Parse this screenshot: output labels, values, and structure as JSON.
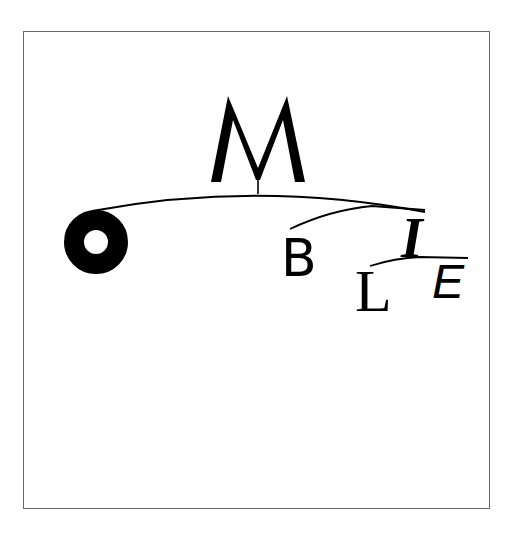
{
  "artwork": {
    "letters": {
      "m": "M",
      "o": "O",
      "b": "B",
      "i": "I",
      "l": "L",
      "e": "E"
    },
    "colors": {
      "ink": "#000000",
      "background": "#ffffff",
      "frame": "#6a6a6a"
    }
  }
}
